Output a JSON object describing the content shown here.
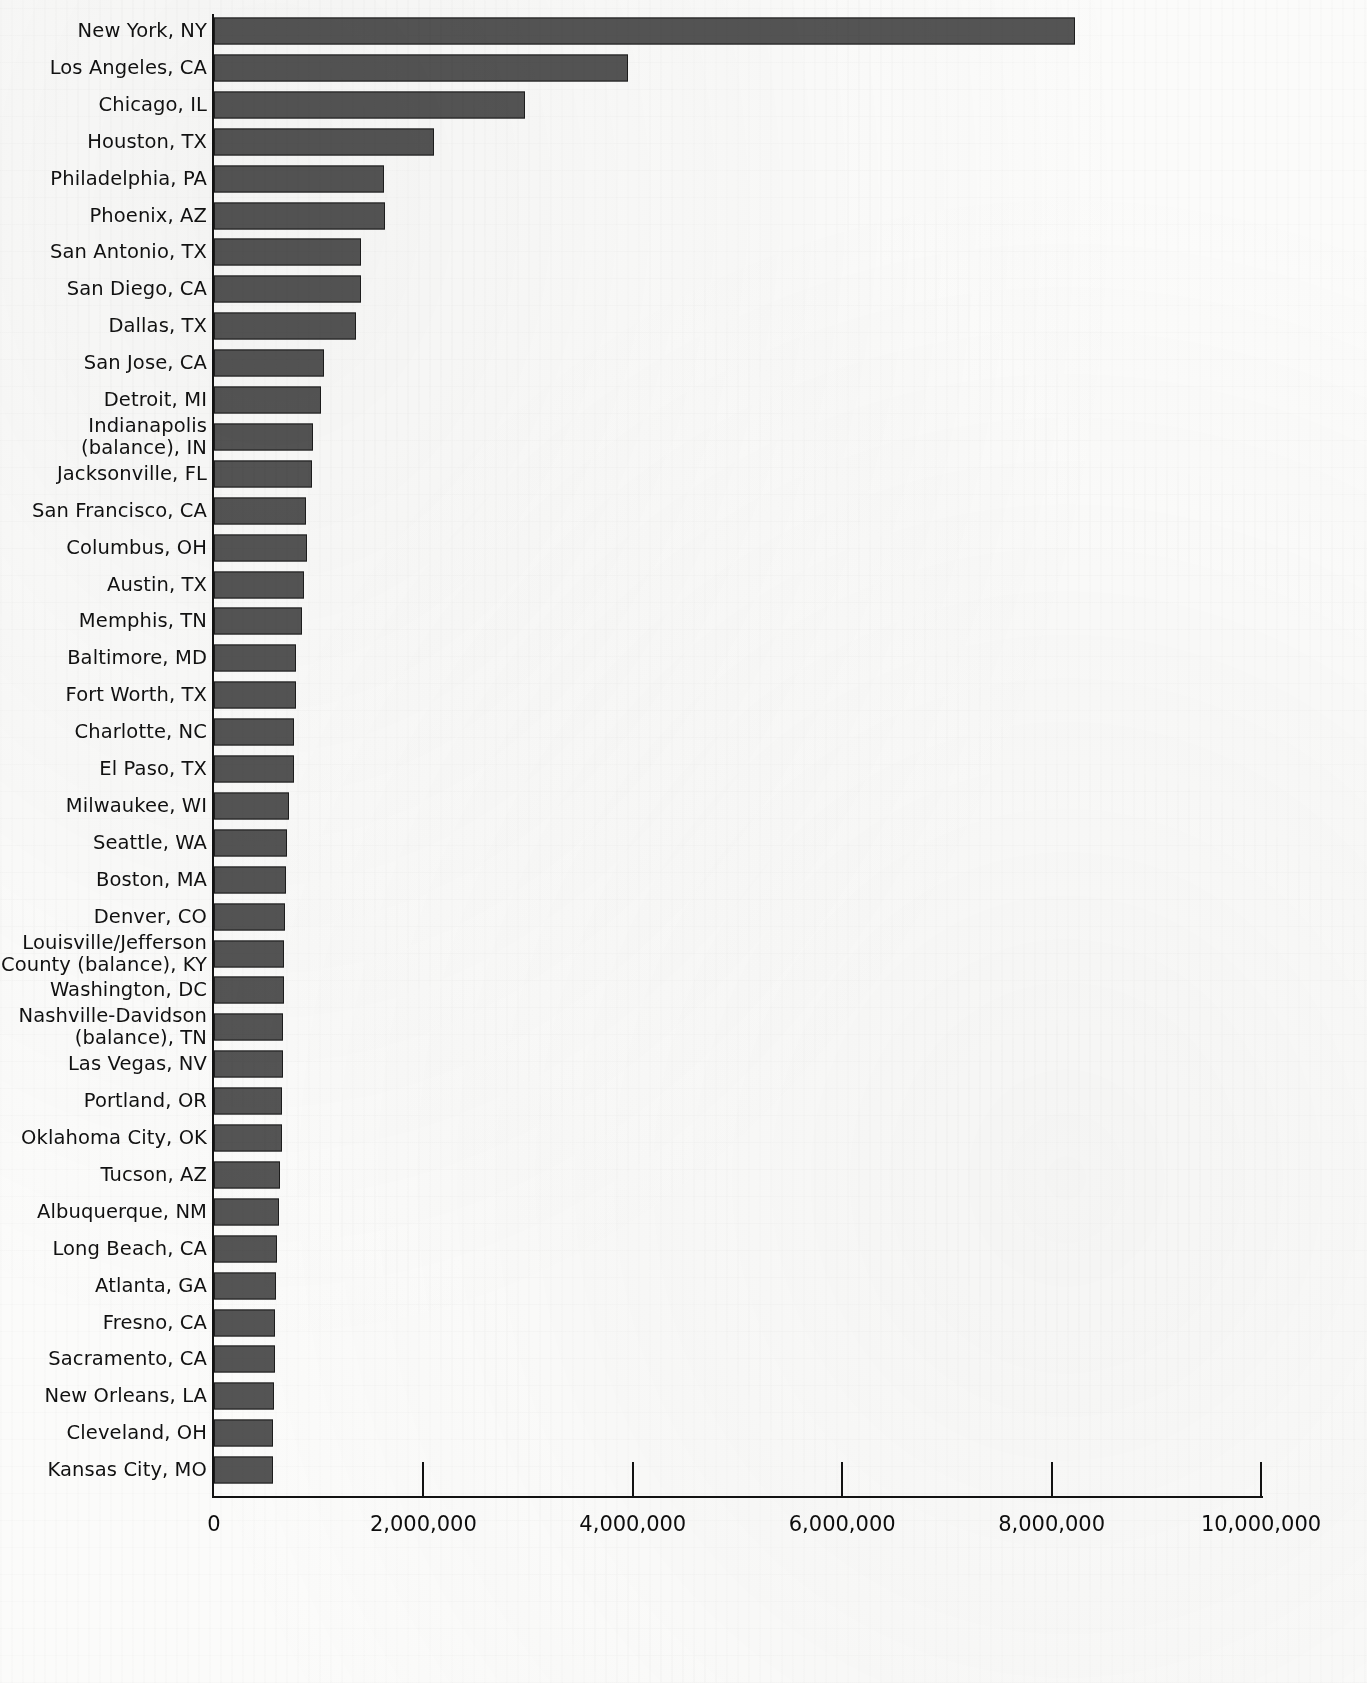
{
  "chart_data": {
    "type": "bar",
    "orientation": "horizontal",
    "title": "",
    "subtitle": "",
    "xlabel": "",
    "ylabel": "",
    "xlim": [
      0,
      10000000
    ],
    "grid": false,
    "legend": null,
    "xticks": [
      0,
      2000000,
      4000000,
      6000000,
      8000000,
      10000000
    ],
    "xtick_labels": [
      "0",
      "2,000,000",
      "4,000,000",
      "6,000,000",
      "8,000,000",
      "10,000,000"
    ],
    "bar_color": "#545454",
    "bar_edge_color": "#1d1d1d",
    "categories": [
      "New York, NY",
      "Los Angeles, CA",
      "Chicago, IL",
      "Houston, TX",
      "Philadelphia, PA",
      "Phoenix, AZ",
      "San Antonio, TX",
      "San Diego, CA",
      "Dallas, TX",
      "San Jose, CA",
      "Detroit, MI",
      "Indianapolis\n(balance), IN",
      "Jacksonville, FL",
      "San Francisco, CA",
      "Columbus, OH",
      "Austin, TX",
      "Memphis, TN",
      "Baltimore, MD",
      "Fort Worth, TX",
      "Charlotte, NC",
      "El Paso, TX",
      "Milwaukee, WI",
      "Seattle, WA",
      "Boston, MA",
      "Denver, CO",
      "Louisville/Jefferson\nCounty (balance), KY",
      "Washington, DC",
      "Nashville-Davidson\n(balance), TN",
      "Las Vegas, NV",
      "Portland, OR",
      "Oklahoma City, OK",
      "Tucson, AZ",
      "Albuquerque, NM",
      "Long Beach, CA",
      "Atlanta, GA",
      "Fresno, CA",
      "Sacramento, CA",
      "New Orleans, LA",
      "Cleveland, OH",
      "Kansas City, MO"
    ],
    "values": [
      8220000,
      3950000,
      2970000,
      2100000,
      1620000,
      1630000,
      1400000,
      1400000,
      1360000,
      1050000,
      1020000,
      950000,
      940000,
      880000,
      890000,
      860000,
      840000,
      780000,
      780000,
      760000,
      760000,
      720000,
      700000,
      690000,
      680000,
      670000,
      670000,
      660000,
      660000,
      650000,
      650000,
      630000,
      620000,
      600000,
      590000,
      580000,
      580000,
      570000,
      560000,
      560000
    ]
  }
}
